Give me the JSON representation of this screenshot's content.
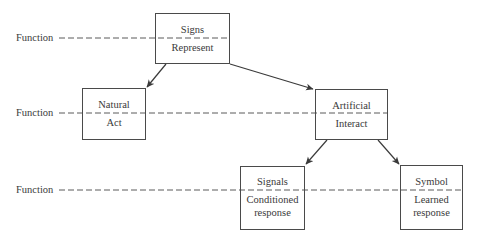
{
  "diagram": {
    "function_label": "Function",
    "rows": [
      {
        "label": "Function",
        "y": 38
      },
      {
        "label": "Function",
        "y": 113
      },
      {
        "label": "Function",
        "y": 190
      }
    ],
    "nodes": [
      {
        "id": "signs",
        "name": "Signs",
        "function": "Represent",
        "x": 155,
        "y": 13,
        "w": 75,
        "h": 51
      },
      {
        "id": "natural",
        "name": "Natural",
        "function": "Act",
        "x": 82,
        "y": 88,
        "w": 64,
        "h": 52
      },
      {
        "id": "artificial",
        "name": "Artificial",
        "function": "Interact",
        "x": 315,
        "y": 89,
        "w": 73,
        "h": 51
      },
      {
        "id": "signals",
        "name": "Signals",
        "function_line1": "Conditioned",
        "function_line2": "response",
        "x": 240,
        "y": 166,
        "w": 65,
        "h": 64
      },
      {
        "id": "symbol",
        "name": "Symbol",
        "function_line1": "Learned",
        "function_line2": "response",
        "x": 400,
        "y": 165,
        "w": 63,
        "h": 65
      }
    ],
    "edges": [
      {
        "from": "signs",
        "to": "natural"
      },
      {
        "from": "signs",
        "to": "artificial"
      },
      {
        "from": "artificial",
        "to": "signals"
      },
      {
        "from": "artificial",
        "to": "symbol"
      }
    ],
    "colors": {
      "line": "#3a3a3a",
      "dash": "#5a5a5a",
      "text": "#3a3a3a",
      "background": "#ffffff"
    }
  }
}
